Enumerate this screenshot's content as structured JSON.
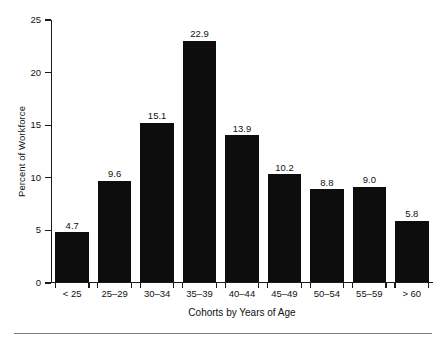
{
  "chart_data": {
    "type": "bar",
    "title": "",
    "xlabel": "Cohorts by Years of Age",
    "ylabel": "Percent of Workforce",
    "categories": [
      "< 25",
      "25–29",
      "30–34",
      "35–39",
      "40–44",
      "45–49",
      "50–54",
      "55–59",
      "> 60"
    ],
    "values": [
      4.7,
      9.6,
      15.1,
      22.9,
      13.9,
      10.2,
      8.8,
      9.0,
      5.8
    ],
    "value_labels": [
      "4.7",
      "9.6",
      "15.1",
      "22.9",
      "13.9",
      "10.2",
      "8.8",
      "9.0",
      "5.8"
    ],
    "ylim": [
      0,
      25
    ],
    "yticks": [
      0,
      5,
      10,
      15,
      20,
      25
    ],
    "ytick_labels": [
      "0",
      "5",
      "10",
      "15",
      "20",
      "25"
    ],
    "grid": false,
    "legend": null,
    "bar_color": "#0d0d0d",
    "axis_color": "#1a1a1a",
    "rule_color": "#7b7b7b",
    "background": "#ffffff"
  }
}
